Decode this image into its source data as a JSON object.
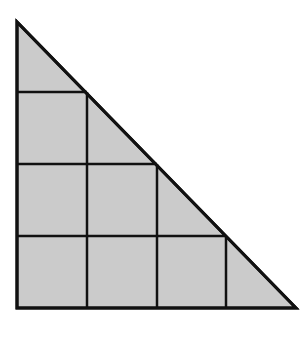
{
  "diagram": {
    "title": "",
    "shape": "right-triangle",
    "colors": {
      "fill": "#cbcbcb",
      "stroke": "#111111",
      "background": "#ffffff"
    },
    "grid_units": 4,
    "triangle": {
      "vertices": [
        [
          17,
          22
        ],
        [
          17,
          308
        ],
        [
          296,
          308
        ]
      ]
    },
    "squares": [
      {
        "row": 1,
        "col": 1
      },
      {
        "row": 2,
        "col": 1
      },
      {
        "row": 2,
        "col": 2
      },
      {
        "row": 3,
        "col": 1
      },
      {
        "row": 3,
        "col": 2
      },
      {
        "row": 3,
        "col": 3
      }
    ],
    "square_count": 6,
    "small_triangle_count": 4
  }
}
